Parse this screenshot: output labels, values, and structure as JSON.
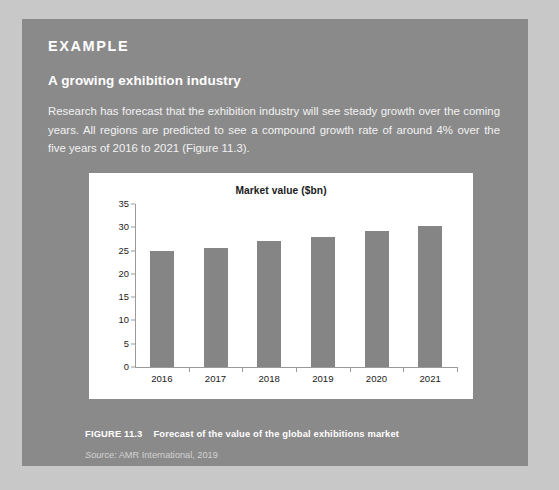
{
  "panel": {
    "kicker": "EXAMPLE",
    "heading": "A growing exhibition industry",
    "body": "Research has forecast that the exhibition industry will see steady growth over the coming years. All regions are predicted to see a compound growth rate of around 4% over the five years of 2016 to 2021 (Figure 11.3).",
    "background_color": "#8a8a8a",
    "text_color": "#ffffff"
  },
  "figure": {
    "number_label": "FIGURE 11.3",
    "caption": "Forecast of the value of the global exhibitions market",
    "source_word": "Source:",
    "source_text": "AMR International, 2019"
  },
  "chart_data": {
    "type": "bar",
    "title": "Market value ($bn)",
    "xlabel": "",
    "ylabel": "",
    "categories": [
      "2016",
      "2017",
      "2018",
      "2019",
      "2020",
      "2021"
    ],
    "values": [
      25,
      25.6,
      27,
      28,
      29.2,
      30.2
    ],
    "ylim": [
      0,
      35
    ],
    "yticks": [
      0,
      5,
      10,
      15,
      20,
      25,
      30,
      35
    ],
    "ytick_labels": [
      "0",
      "5",
      "10",
      "15",
      "20",
      "25",
      "30",
      "35"
    ],
    "grid": false,
    "legend": false,
    "bar_color": "#858585",
    "plot_background": "#ffffff",
    "axis_color": "#9a9a9a"
  }
}
